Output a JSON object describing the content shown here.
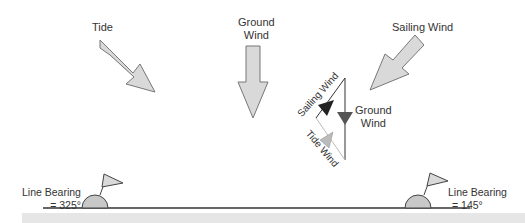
{
  "labels": {
    "tide": "Tide",
    "ground_wind_line1": "Ground",
    "ground_wind_line2": "Wind",
    "sailing_wind": "Sailing Wind",
    "vector_sailing_wind": "Sailing Wind",
    "vector_ground_wind_line1": "Ground",
    "vector_ground_wind_line2": "Wind",
    "vector_tide_wind": "Tide Wind",
    "left_bearing_line1": "Line Bearing",
    "left_bearing_line2": "= 325°",
    "right_bearing_line1": "Line Bearing",
    "right_bearing_line2": "= 145°"
  },
  "colors": {
    "arrow_fill": "#d9d9d9",
    "arrow_stroke": "#777777",
    "sailing_triangle": "#222222",
    "ground_triangle": "#555555",
    "tide_triangle": "#bbbbbb",
    "ground_bar": "#e6e6e6",
    "line": "#333333"
  }
}
